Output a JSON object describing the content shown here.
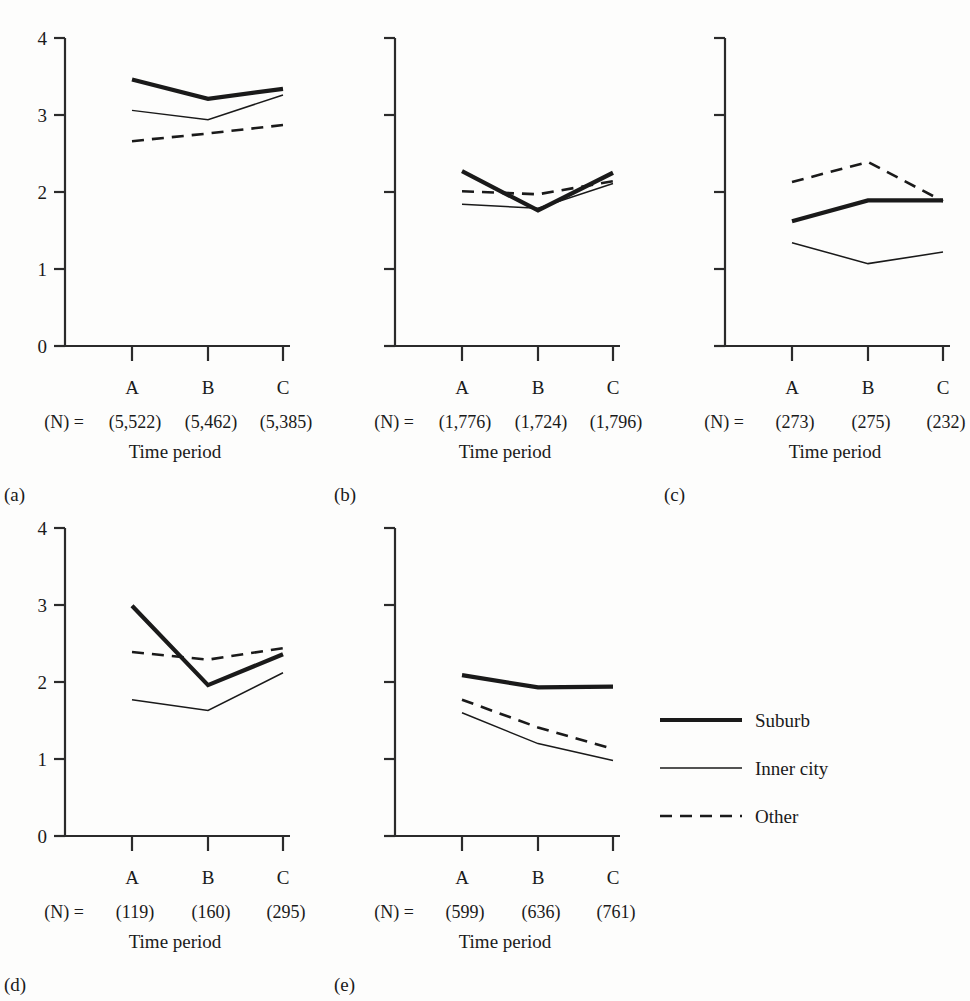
{
  "figure": {
    "categories": [
      "A",
      "B",
      "C"
    ],
    "xlabel": "Time period",
    "n_prefix": "(N) =",
    "y_ticks": [
      "0",
      "1",
      "2",
      "3",
      "4"
    ],
    "ylim": [
      0,
      4
    ],
    "line_color": "#1a1a1a",
    "background": "#fdfdfc"
  },
  "legend": {
    "position": "right-middle",
    "entries": [
      {
        "label": "Suburb",
        "style": "thick-solid"
      },
      {
        "label": "Inner city",
        "style": "thin-solid"
      },
      {
        "label": "Other",
        "style": "dashed"
      }
    ]
  },
  "chart_data": [
    {
      "type": "line",
      "panel": "(a)",
      "title": "",
      "xlabel": "Time period",
      "ylabel": "",
      "categories": [
        "A",
        "B",
        "C"
      ],
      "ylim": [
        0,
        4
      ],
      "yticks": [
        0,
        1,
        2,
        3,
        4
      ],
      "ytick_labels_shown": true,
      "grid": false,
      "n_label": "(N) =",
      "n_values": [
        "(5,522)",
        "(5,462)",
        "(5,385)"
      ],
      "series": [
        {
          "name": "Suburb",
          "style": "thick-solid",
          "values": [
            3.46,
            3.21,
            3.34
          ]
        },
        {
          "name": "Inner city",
          "style": "thin-solid",
          "values": [
            3.06,
            2.94,
            3.26
          ]
        },
        {
          "name": "Other",
          "style": "dashed",
          "values": [
            2.66,
            2.76,
            2.87
          ]
        }
      ]
    },
    {
      "type": "line",
      "panel": "(b)",
      "title": "",
      "xlabel": "Time period",
      "ylabel": "",
      "categories": [
        "A",
        "B",
        "C"
      ],
      "ylim": [
        0,
        4
      ],
      "yticks": [
        0,
        1,
        2,
        3,
        4
      ],
      "ytick_labels_shown": false,
      "grid": false,
      "n_label": "(N) =",
      "n_values": [
        "(1,776)",
        "(1,724)",
        "(1,796)"
      ],
      "series": [
        {
          "name": "Suburb",
          "style": "thick-solid",
          "values": [
            2.27,
            1.76,
            2.25
          ]
        },
        {
          "name": "Inner city",
          "style": "thin-solid",
          "values": [
            1.84,
            1.79,
            2.11
          ]
        },
        {
          "name": "Other",
          "style": "dashed",
          "values": [
            2.01,
            1.97,
            2.14
          ]
        }
      ]
    },
    {
      "type": "line",
      "panel": "(c)",
      "title": "",
      "xlabel": "Time period",
      "ylabel": "",
      "categories": [
        "A",
        "B",
        "C"
      ],
      "ylim": [
        0,
        4
      ],
      "yticks": [
        0,
        1,
        2,
        3,
        4
      ],
      "ytick_labels_shown": false,
      "grid": false,
      "n_label": "(N) =",
      "n_values": [
        "(273)",
        "(275)",
        "(232)"
      ],
      "series": [
        {
          "name": "Suburb",
          "style": "thick-solid",
          "values": [
            1.62,
            1.89,
            1.89
          ]
        },
        {
          "name": "Inner city",
          "style": "thin-solid",
          "values": [
            1.34,
            1.07,
            1.22
          ]
        },
        {
          "name": "Other",
          "style": "dashed",
          "values": [
            2.13,
            2.39,
            1.88
          ]
        }
      ]
    },
    {
      "type": "line",
      "panel": "(d)",
      "title": "",
      "xlabel": "Time period",
      "ylabel": "",
      "categories": [
        "A",
        "B",
        "C"
      ],
      "ylim": [
        0,
        4
      ],
      "yticks": [
        0,
        1,
        2,
        3,
        4
      ],
      "ytick_labels_shown": true,
      "grid": false,
      "n_label": "(N) =",
      "n_values": [
        "(119)",
        "(160)",
        "(295)"
      ],
      "series": [
        {
          "name": "Suburb",
          "style": "thick-solid",
          "values": [
            2.99,
            1.96,
            2.36
          ]
        },
        {
          "name": "Inner city",
          "style": "thin-solid",
          "values": [
            1.77,
            1.63,
            2.12
          ]
        },
        {
          "name": "Other",
          "style": "dashed",
          "values": [
            2.39,
            2.29,
            2.44
          ]
        }
      ]
    },
    {
      "type": "line",
      "panel": "(e)",
      "title": "",
      "xlabel": "Time period",
      "ylabel": "",
      "categories": [
        "A",
        "B",
        "C"
      ],
      "ylim": [
        0,
        4
      ],
      "yticks": [
        0,
        1,
        2,
        3,
        4
      ],
      "ytick_labels_shown": false,
      "grid": false,
      "n_label": "(N) =",
      "n_values": [
        "(599)",
        "(636)",
        "(761)"
      ],
      "series": [
        {
          "name": "Suburb",
          "style": "thick-solid",
          "values": [
            2.09,
            1.93,
            1.94
          ]
        },
        {
          "name": "Inner city",
          "style": "thin-solid",
          "values": [
            1.6,
            1.2,
            0.98
          ]
        },
        {
          "name": "Other",
          "style": "dashed",
          "values": [
            1.77,
            1.41,
            1.13
          ]
        }
      ]
    }
  ]
}
